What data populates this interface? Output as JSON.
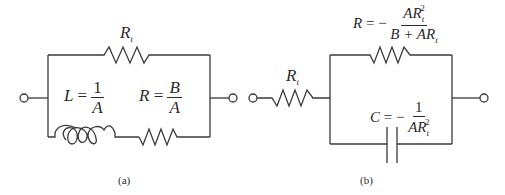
{
  "figure": {
    "panel_a": {
      "caption": "(a)",
      "top_resistor": {
        "symbol": "R",
        "subscript": "t"
      },
      "inductor": {
        "lhs": "L",
        "eq": "=",
        "numerator": "1",
        "denominator": "A"
      },
      "series_resistor": {
        "lhs": "R",
        "eq": "=",
        "numerator": "B",
        "denominator": "A"
      }
    },
    "panel_b": {
      "caption": "(b)",
      "series_resistor": {
        "symbol": "R",
        "subscript": "t"
      },
      "parallel_resistor": {
        "lhs": "R",
        "eq": "= −",
        "num_A": "A",
        "num_R": "R",
        "num_sub": "t",
        "num_sup": "2",
        "den_B": "B + A",
        "den_R": "R",
        "den_sub": "t"
      },
      "capacitor": {
        "lhs": "C",
        "eq": "= −",
        "numerator": "1",
        "den_A": "A",
        "den_R": "R",
        "den_sub": "t",
        "den_sup": "2"
      }
    },
    "colors": {
      "line": "#3a3a3a",
      "text": "#2a2a2a",
      "background": "#ffffff"
    }
  }
}
